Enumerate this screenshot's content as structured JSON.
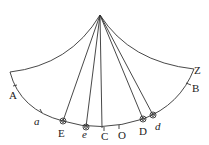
{
  "diagram": {
    "type": "pendulum arc / sector diagram",
    "apex": {
      "x": 100,
      "y": 15
    },
    "colors": {
      "line": "#333333",
      "text": "#222222",
      "background": "#ffffff"
    },
    "labels": {
      "A": "A",
      "a": "a",
      "E": "E",
      "e": "e",
      "C": "C",
      "O": "O",
      "D": "D",
      "d": "d",
      "B": "B",
      "Z": "Z"
    },
    "points": [
      {
        "name": "E",
        "x": 63,
        "y": 121,
        "circled": true
      },
      {
        "name": "e",
        "x": 86,
        "y": 127,
        "circled": true
      },
      {
        "name": "D",
        "x": 143,
        "y": 119,
        "circled": true
      },
      {
        "name": "d",
        "x": 153,
        "y": 115,
        "circled": true
      }
    ],
    "ticks": [
      "A",
      "a",
      "C",
      "O",
      "B"
    ]
  }
}
